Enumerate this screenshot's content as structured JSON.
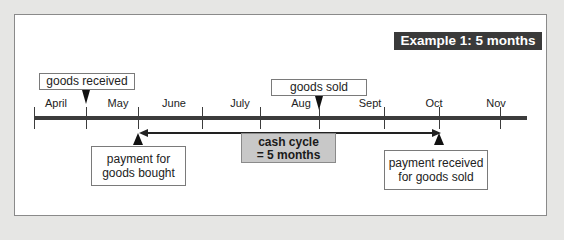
{
  "title": "Example 1: 5 months",
  "colors": {
    "background": "#e6e6e4",
    "panel": "#ffffff",
    "title_badge": "#3a3a3a",
    "timeline": "#3c3c3c",
    "cash_box": "#c8c8c8"
  },
  "timeline": {
    "months": [
      "April",
      "May",
      "June",
      "July",
      "Aug",
      "Sept",
      "Oct",
      "Nov"
    ]
  },
  "events": {
    "goods_received": "goods received",
    "goods_sold": "goods sold",
    "payment_for_goods_bought": {
      "line1": "payment for",
      "line2": "goods bought"
    },
    "payment_received": {
      "line1": "payment received",
      "line2": "for goods sold"
    }
  },
  "cash_cycle": {
    "line1": "cash cycle",
    "line2": "= 5 months"
  }
}
